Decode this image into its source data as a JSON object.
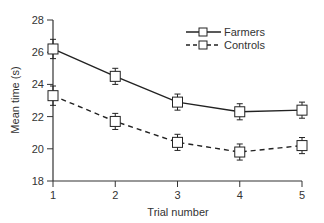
{
  "chart_data": {
    "type": "line",
    "title": "",
    "xlabel": "Trial number",
    "ylabel": "Mean time (s)",
    "x": [
      1,
      2,
      3,
      4,
      5
    ],
    "x_ticks": [
      "1",
      "2",
      "3",
      "4",
      "5"
    ],
    "y_ticks": [
      "18",
      "20",
      "22",
      "24",
      "26",
      "28"
    ],
    "ylim": [
      18,
      28
    ],
    "xlim": [
      1,
      5
    ],
    "grid": false,
    "legend_position": "upper right",
    "series": [
      {
        "name": "Farmers",
        "style": "solid",
        "marker": "open-square",
        "values": [
          26.2,
          24.5,
          22.9,
          22.3,
          22.4
        ],
        "error": [
          0.6,
          0.5,
          0.5,
          0.5,
          0.5
        ]
      },
      {
        "name": "Controls",
        "style": "dashed",
        "marker": "open-square",
        "values": [
          23.3,
          21.7,
          20.4,
          19.8,
          20.2
        ],
        "error": [
          0.6,
          0.5,
          0.5,
          0.5,
          0.5
        ]
      }
    ]
  },
  "colors": {
    "line": "#222222",
    "axis": "#333333",
    "marker_fill": "#ffffff"
  }
}
